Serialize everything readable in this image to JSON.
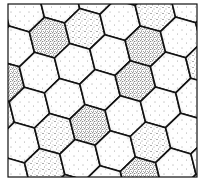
{
  "figure": {
    "kind": "hexagonal-cell-tessellation",
    "frame": {
      "x": 8,
      "y": 4,
      "width": 189,
      "height": 173,
      "stroke": "#111111"
    },
    "grid": {
      "hex_radius": 21,
      "rotation_deg": -14,
      "origin_x": 100,
      "origin_y": 90
    },
    "colors": {
      "background": "#ffffff",
      "cell_edge": "#111111",
      "stipple": "#222222"
    },
    "shading_levels": [
      "light",
      "medium",
      "dense"
    ],
    "dense_cells": [
      [
        -2,
        -1
      ],
      [
        0,
        -2
      ],
      [
        -1,
        1
      ],
      [
        1,
        0
      ],
      [
        2,
        -1
      ],
      [
        -1,
        3
      ]
    ],
    "medium_cells": [
      [
        -3,
        0
      ],
      [
        -2,
        1
      ],
      [
        1,
        -2
      ],
      [
        3,
        -2
      ],
      [
        3,
        0
      ],
      [
        -3,
        2
      ],
      [
        0,
        2
      ]
    ]
  }
}
